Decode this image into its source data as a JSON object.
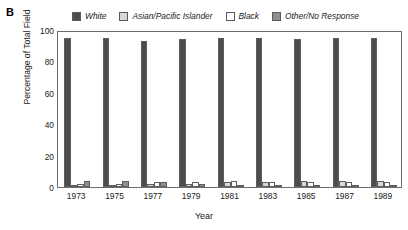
{
  "panel_label": "B",
  "legend": {
    "items": [
      {
        "label": "White",
        "color": "#4d4d4d",
        "icon": "legend-swatch-white-series"
      },
      {
        "label": "Asian/Pacific Islander",
        "color": "#d8d8d8",
        "icon": "legend-swatch-asian-pacific-islander"
      },
      {
        "label": "Black",
        "color": "#ffffff",
        "icon": "legend-swatch-black-series"
      },
      {
        "label": "Other/No Response",
        "color": "#8f8f8f",
        "icon": "legend-swatch-other-no-response"
      }
    ]
  },
  "axes": {
    "y_title": "Percentage of Total Field",
    "x_title": "Year",
    "y_ticks": [
      "0",
      "20",
      "40",
      "60",
      "80",
      "100"
    ]
  },
  "chart_data": {
    "type": "bar",
    "title": "",
    "xlabel": "Year",
    "ylabel": "Percentage of Total Field",
    "ylim": [
      0,
      100
    ],
    "yticks": [
      0,
      20,
      40,
      60,
      80,
      100
    ],
    "grid": false,
    "legend_position": "top",
    "categories": [
      "1973",
      "1975",
      "1977",
      "1979",
      "1981",
      "1983",
      "1985",
      "1987",
      "1989"
    ],
    "series": [
      {
        "name": "White",
        "color": "#4d4d4d",
        "values": [
          95,
          95,
          93,
          94,
          95,
          95,
          94,
          95,
          95
        ]
      },
      {
        "name": "Asian/Pacific Islander",
        "color": "#d8d8d8",
        "values": [
          1,
          1,
          2,
          2,
          3,
          3,
          4,
          4,
          4
        ]
      },
      {
        "name": "Black",
        "color": "#ffffff",
        "values": [
          2,
          2,
          3,
          3,
          4,
          3,
          3,
          3,
          3
        ]
      },
      {
        "name": "Other/No Response",
        "color": "#8f8f8f",
        "values": [
          4,
          4,
          3,
          2,
          1,
          1,
          1,
          1,
          1
        ]
      }
    ]
  }
}
